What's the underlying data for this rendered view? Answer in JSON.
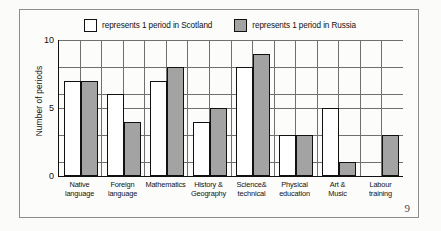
{
  "page_number": "9",
  "legend": {
    "entries": [
      {
        "swatch": "white-square-icon",
        "label": "represents 1 period in Scotland",
        "color": "#ffffff"
      },
      {
        "swatch": "gray-square-icon",
        "label": "represents 1 period in Russia",
        "color": "#a3a3a3"
      }
    ]
  },
  "chart_data": {
    "type": "bar",
    "title": "",
    "xlabel": "",
    "ylabel": "Number of periods",
    "ylim": [
      0,
      10
    ],
    "ytick_labels": [
      "0",
      "5",
      "10"
    ],
    "ytick_values": [
      0,
      5,
      10
    ],
    "grid": true,
    "legend_position": "top",
    "categories": [
      "Native language",
      "Foreign language",
      "Mathematics",
      "History & Geography",
      "Science& technical",
      "Physical education",
      "Art & Music",
      "Labour training"
    ],
    "category_lines": [
      [
        "Native",
        "language"
      ],
      [
        "Foreign",
        "language"
      ],
      [
        "Mathematics",
        ""
      ],
      [
        "History &",
        "Geography"
      ],
      [
        "Science&",
        "technical"
      ],
      [
        "Physical",
        "education"
      ],
      [
        "Art &",
        "Music"
      ],
      [
        "Labour",
        "training"
      ]
    ],
    "series": [
      {
        "name": "Scotland",
        "color": "#ffffff",
        "values": [
          7,
          6,
          7,
          4,
          8,
          3,
          5,
          0
        ]
      },
      {
        "name": "Russia",
        "color": "#a3a3a3",
        "values": [
          7,
          4,
          8,
          5,
          9,
          3,
          1,
          3
        ]
      }
    ]
  }
}
